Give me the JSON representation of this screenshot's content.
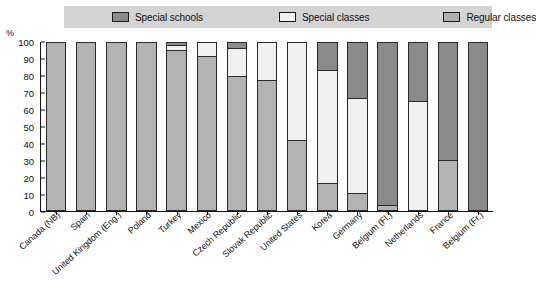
{
  "chart_data": {
    "type": "bar",
    "title": "",
    "subtitle": "",
    "xlabel": "",
    "ylabel": "%",
    "ylim": [
      0,
      100
    ],
    "yticks": [
      0,
      10,
      20,
      30,
      40,
      50,
      60,
      70,
      80,
      90,
      100
    ],
    "grid": false,
    "stacked": true,
    "legend_position": "top",
    "legend": [
      "Special schools",
      "Special classes",
      "Regular classes"
    ],
    "colors": {
      "special_schools": "#8a8a8a",
      "special_classes": "#f0f0f0",
      "regular_classes": "#b2b2b2",
      "legend_background": "#d4d4d4",
      "axis": "#111111"
    },
    "categories": [
      "Canada (NB)",
      "Spain",
      "United Kingdom (Eng.)",
      "Poland",
      "Turkey",
      "Mexico",
      "Czech Republic",
      "Slovak Republic",
      "United States",
      "Korea",
      "Germany",
      "Belgium (Fl.)",
      "Netherlands",
      "France",
      "Belgium (Fr.)"
    ],
    "series": [
      {
        "name": "Regular classes",
        "values": [
          100,
          100,
          100,
          100,
          96,
          92,
          80,
          78,
          42,
          16,
          10,
          3,
          0,
          30,
          0
        ]
      },
      {
        "name": "Special classes",
        "values": [
          0,
          0,
          0,
          0,
          3,
          8,
          17,
          22,
          58,
          68,
          57,
          0,
          65,
          0,
          0
        ]
      },
      {
        "name": "Special schools",
        "values": [
          0,
          0,
          0,
          0,
          1,
          0,
          3,
          0,
          0,
          16,
          33,
          97,
          35,
          70,
          100
        ]
      }
    ]
  },
  "axis": {
    "unit_label": "%",
    "tick_labels": [
      "100",
      "90",
      "80",
      "70",
      "60",
      "50",
      "40",
      "30",
      "20",
      "10",
      "0"
    ]
  },
  "legend": {
    "items": [
      {
        "label": "Special schools",
        "swatch": "swatch-special-schools"
      },
      {
        "label": "Special classes",
        "swatch": "swatch-special-classes"
      },
      {
        "label": "Regular classes",
        "swatch": "swatch-regular-classes"
      }
    ]
  }
}
